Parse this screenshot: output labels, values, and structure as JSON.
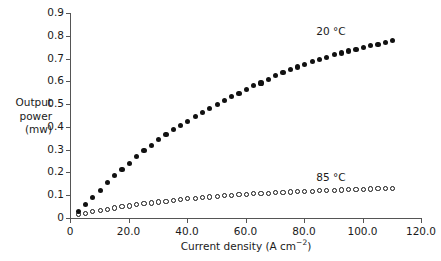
{
  "chart_data": {
    "type": "scatter",
    "title": "",
    "xlabel": "Current density (A cm⁻²)",
    "ylabel": "Output power (mw)",
    "ylabel_lines": [
      "Output",
      "power",
      "(mw)"
    ],
    "xlim": [
      0,
      120
    ],
    "ylim": [
      0,
      0.9
    ],
    "grid": false,
    "legend_position": "inline-annotation",
    "xticks": [
      0,
      20,
      40,
      60,
      80,
      100,
      120
    ],
    "xticklabels": [
      "0",
      "20.0",
      "40.0",
      "60.0",
      "80.0",
      "100.0",
      "120.0"
    ],
    "yticks": [
      0,
      0.1,
      0.2,
      0.3,
      0.4,
      0.5,
      0.6,
      0.7,
      0.8,
      0.9
    ],
    "yticklabels": [
      "0",
      "0.1",
      "0.2",
      "0.3",
      "0.4",
      "0.5",
      "0.6",
      "0.7",
      "0.8",
      "0.9"
    ],
    "series": [
      {
        "name": "20 °C",
        "marker": "filled-circle",
        "color": "#111111",
        "annotation": "20 °C",
        "annotation_x": 90.0,
        "annotation_y": 0.815,
        "x": [
          2.8,
          5.3,
          7.8,
          10.3,
          12.8,
          15.3,
          17.8,
          20.3,
          22.8,
          25.3,
          27.8,
          30.3,
          32.8,
          35.3,
          37.8,
          40.3,
          42.8,
          45.3,
          47.8,
          50.3,
          52.8,
          55.3,
          57.8,
          60.3,
          62.8,
          65.3,
          67.8,
          70.3,
          72.8,
          75.3,
          77.8,
          80.3,
          82.8,
          85.3,
          87.8,
          90.3,
          92.8,
          95.3,
          97.8,
          100.3,
          102.8,
          105.3,
          107.8,
          110.3
        ],
        "y": [
          0.028,
          0.06,
          0.09,
          0.122,
          0.155,
          0.187,
          0.214,
          0.241,
          0.27,
          0.298,
          0.32,
          0.344,
          0.367,
          0.388,
          0.407,
          0.425,
          0.445,
          0.462,
          0.481,
          0.497,
          0.515,
          0.532,
          0.548,
          0.565,
          0.58,
          0.593,
          0.609,
          0.624,
          0.637,
          0.651,
          0.663,
          0.674,
          0.686,
          0.697,
          0.706,
          0.716,
          0.724,
          0.733,
          0.741,
          0.748,
          0.756,
          0.763,
          0.771,
          0.779
        ]
      },
      {
        "name": "85 °C",
        "marker": "open-circle",
        "color": "#111111",
        "annotation": "85 °C",
        "annotation_x": 90.0,
        "annotation_y": 0.175,
        "x": [
          2.8,
          5.3,
          7.8,
          10.3,
          12.8,
          15.3,
          17.8,
          20.3,
          22.8,
          25.3,
          27.8,
          30.3,
          32.8,
          35.3,
          37.8,
          40.3,
          42.8,
          45.3,
          47.8,
          50.3,
          52.8,
          55.3,
          57.8,
          60.3,
          62.8,
          65.3,
          67.8,
          70.3,
          72.8,
          75.3,
          77.8,
          80.3,
          82.8,
          85.3,
          87.8,
          90.3,
          92.8,
          95.3,
          97.8,
          100.3,
          102.8,
          105.3,
          107.8,
          110.3
        ],
        "y": [
          0.014,
          0.02,
          0.027,
          0.033,
          0.039,
          0.044,
          0.049,
          0.053,
          0.058,
          0.062,
          0.066,
          0.07,
          0.074,
          0.078,
          0.081,
          0.084,
          0.087,
          0.09,
          0.092,
          0.095,
          0.097,
          0.1,
          0.102,
          0.104,
          0.106,
          0.108,
          0.109,
          0.111,
          0.113,
          0.114,
          0.116,
          0.117,
          0.118,
          0.12,
          0.121,
          0.122,
          0.123,
          0.124,
          0.125,
          0.126,
          0.127,
          0.128,
          0.129,
          0.13
        ]
      }
    ]
  }
}
